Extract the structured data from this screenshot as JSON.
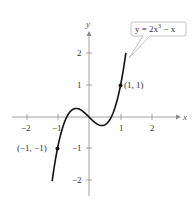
{
  "chart_data": {
    "type": "line",
    "title": "",
    "xlabel": "x",
    "ylabel": "y",
    "xlim": [
      -2.5,
      2.5
    ],
    "ylim": [
      -2.5,
      2.5
    ],
    "grid": false,
    "x_ticks": [
      -2,
      -1,
      1,
      2
    ],
    "y_ticks": [
      -2,
      -1,
      1,
      2
    ],
    "x_tick_labels": [
      "−2",
      "−1",
      "1",
      "2"
    ],
    "y_tick_labels": [
      "−2",
      "−1",
      "1",
      "2"
    ],
    "series": [
      {
        "name": "y = 2x³ − x",
        "function": "2x^3 - x",
        "x": [
          -1.17,
          -1.0,
          -0.8,
          -0.6,
          -0.41,
          -0.2,
          0,
          0.2,
          0.41,
          0.6,
          0.8,
          1.0,
          1.17
        ],
        "y": [
          -2.03,
          -1.0,
          -0.22,
          0.17,
          0.27,
          0.18,
          0,
          -0.18,
          -0.27,
          -0.17,
          0.22,
          1.0,
          2.03
        ]
      }
    ],
    "points": [
      {
        "x": -1,
        "y": -1,
        "label": "(−1, −1)"
      },
      {
        "x": 1,
        "y": 1,
        "label": "(1, 1)"
      }
    ],
    "annotations": [
      {
        "text": "y = 2x³ − x",
        "type": "callout"
      }
    ]
  },
  "labels": {
    "x_axis": "x",
    "y_axis": "y",
    "xt_m2": "−2",
    "xt_m1": "−1",
    "xt_1": "1",
    "xt_2": "2",
    "yt_2": "2",
    "yt_1": "1",
    "yt_m1": "−1",
    "yt_m2": "−2",
    "pt1": "(1, 1)",
    "pt2": "(−1, −1)",
    "eq_prefix": "y = 2x",
    "eq_exp": "3",
    "eq_suffix": " − x"
  }
}
